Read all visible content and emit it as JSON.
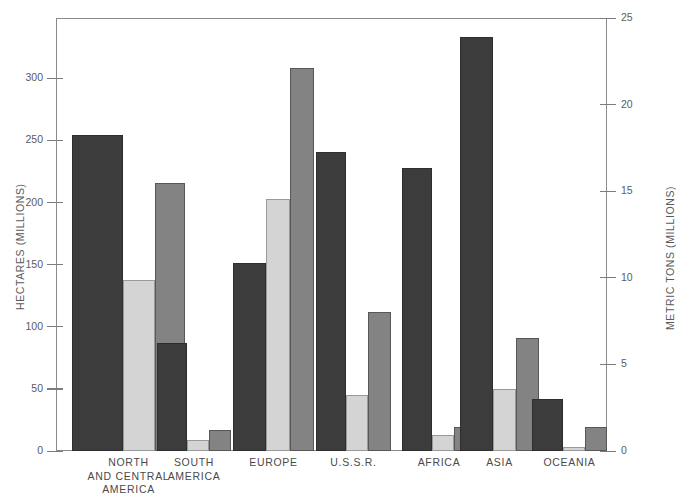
{
  "chart_data": {
    "type": "bar",
    "title": "",
    "subtitle": "",
    "categories": [
      "NORTH\nAND CENTRAL\nAMERICA",
      "SOUTH\nAMERICA",
      "EUROPE",
      "U.S.S.R.",
      "AFRICA",
      "ASIA",
      "OCEANIA"
    ],
    "series": [
      {
        "name": "series-dark",
        "axis": "left",
        "unit": "hectares-millions",
        "color": "#3c3c3c",
        "values": [
          254,
          87,
          151,
          241,
          228,
          333,
          42
        ]
      },
      {
        "name": "series-light",
        "axis": "left",
        "unit": "hectares-millions",
        "color": "#d4d4d4",
        "values": [
          138,
          9,
          203,
          45,
          13,
          50,
          3
        ]
      },
      {
        "name": "series-medium",
        "axis": "right",
        "unit": "metric-tons-millions",
        "color": "#838383",
        "values": [
          15.5,
          1.2,
          22.1,
          8.0,
          1.4,
          6.5,
          1.4
        ]
      }
    ],
    "left_axis": {
      "label": "HECTARES (MILLIONS)",
      "ticks": [
        0,
        50,
        100,
        150,
        200,
        250,
        300
      ],
      "ticklabels": [
        "0",
        "50",
        "100",
        "150",
        "200",
        "250",
        "300"
      ],
      "min": 0,
      "max": 348.5
    },
    "right_axis": {
      "label": "METRIC TONS (MILLIONS)",
      "ticks": [
        0,
        5,
        10,
        15,
        20,
        25
      ],
      "ticklabels": [
        "0",
        "5",
        "10",
        "15",
        "20",
        "25"
      ],
      "min": 0,
      "max": 25
    },
    "xlabel": "",
    "grid": false,
    "legend": "none",
    "frame": true,
    "background": "#ffffff"
  }
}
